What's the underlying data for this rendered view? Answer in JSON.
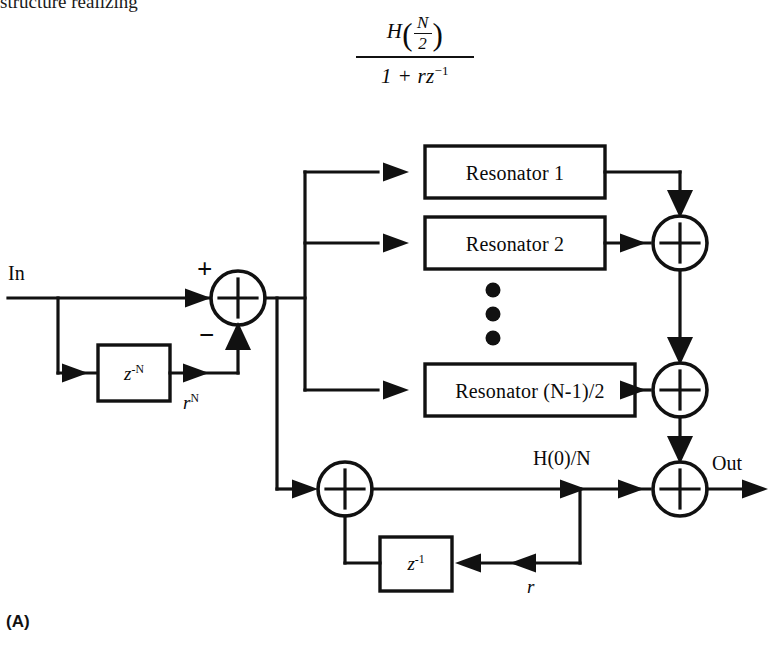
{
  "page": {
    "header_text": "structure realizing",
    "panel_tag": "(A)",
    "background": "#ffffff",
    "ink": "#0a0a0a"
  },
  "transfer_function": {
    "description": "Resonator transfer function annotation above the resonator bank",
    "numerator_function": "H",
    "numerator_arg_top": "N",
    "numerator_arg_bottom": "2",
    "denominator_text": "1 + rz",
    "denominator_exponent": "−1"
  },
  "blocks": {
    "resonators": [
      {
        "label": "Resonator 1"
      },
      {
        "label": "Resonator 2"
      },
      {
        "label": "Resonator (N-1)/2"
      }
    ],
    "ellipsis_dots": 3,
    "delay_feedforward": {
      "base": "z",
      "exponent": "-N"
    },
    "delay_feedback": {
      "base": "z",
      "exponent": "-1"
    }
  },
  "signals": {
    "input_label": "In",
    "output_label": "Out",
    "gain_comb": "r",
    "gain_comb_exponent": "N",
    "gain_dc": "r",
    "dc_path_label": "H(0)/N"
  },
  "adders": {
    "input_sum_plus": "+",
    "input_sum_minus": "−",
    "symbol": "plus-in-circle",
    "count": 5
  },
  "colors": {
    "line": "#111111",
    "fill": "#ffffff",
    "text": "#0a0a0a"
  }
}
